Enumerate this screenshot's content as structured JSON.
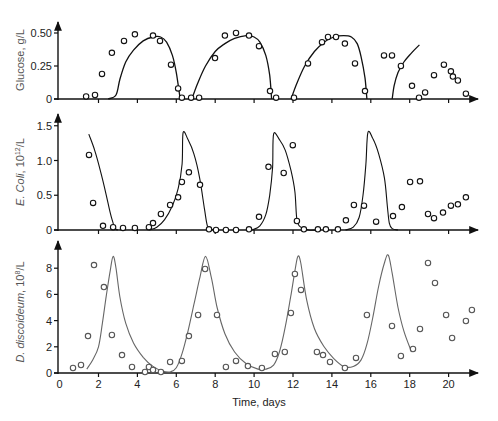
{
  "chart_data": [
    {
      "type": "line",
      "panel": "top",
      "title": "",
      "ylabel": "Glucose, g/L",
      "xlabel": "",
      "xlim": [
        0,
        21.5
      ],
      "ylim": [
        0,
        0.58
      ],
      "yticks": [
        0,
        0.25,
        0.5
      ],
      "ytick_labels": [
        "0",
        "0.25",
        "0.50"
      ],
      "xticks": [
        0,
        2,
        4,
        6,
        8,
        10,
        12,
        14,
        16,
        18,
        20
      ],
      "grid": false,
      "series": [
        {
          "name": "Experiment",
          "style": "open-circle",
          "x": [
            1.36,
            1.82,
            2.18,
            2.69,
            3.31,
            3.87,
            4.8,
            5.16,
            5.73,
            6.09,
            6.29,
            6.76,
            7.17,
            7.99,
            8.5,
            9.07,
            9.74,
            10.25,
            10.82,
            11.13,
            12.05,
            12.77,
            13.49,
            13.8,
            14.21,
            14.67,
            15.19,
            15.7,
            16.68,
            17.09,
            17.55,
            18.12,
            18.48,
            18.79,
            19.25,
            19.76,
            20.12,
            20.22,
            20.48,
            20.89
          ],
          "y": [
            0.02,
            0.03,
            0.19,
            0.35,
            0.44,
            0.49,
            0.48,
            0.44,
            0.26,
            0.08,
            0.01,
            0.01,
            0.01,
            0.31,
            0.48,
            0.5,
            0.48,
            0.4,
            0.06,
            0.01,
            0.01,
            0.27,
            0.43,
            0.47,
            0.47,
            0.42,
            0.27,
            0.06,
            0.33,
            0.33,
            0.25,
            0.1,
            0.01,
            0.05,
            0.18,
            0.26,
            0.21,
            0.17,
            0.14,
            0.04
          ]
        },
        {
          "name": "Model",
          "style": "solid-line",
          "segments": [
            {
              "x": [
                2.5,
                2.9,
                3.1,
                3.4,
                3.8,
                4.3,
                4.8,
                5.2,
                5.5,
                5.8,
                6.0,
                6.2
              ],
              "y": [
                0.0,
                0.03,
                0.15,
                0.28,
                0.37,
                0.44,
                0.47,
                0.47,
                0.43,
                0.33,
                0.2,
                0.0
              ]
            },
            {
              "x": [
                6.8,
                7.1,
                7.5,
                8.0,
                8.5,
                9.0,
                9.6,
                10.0,
                10.3,
                10.6,
                10.8,
                10.9
              ],
              "y": [
                0.0,
                0.12,
                0.25,
                0.36,
                0.42,
                0.46,
                0.48,
                0.47,
                0.43,
                0.33,
                0.18,
                0.0
              ]
            },
            {
              "x": [
                11.9,
                12.2,
                12.6,
                13.1,
                13.6,
                14.1,
                14.6,
                15.0,
                15.3,
                15.5,
                15.7,
                15.8
              ],
              "y": [
                0.0,
                0.12,
                0.25,
                0.36,
                0.43,
                0.47,
                0.48,
                0.47,
                0.42,
                0.32,
                0.16,
                0.0
              ]
            },
            {
              "x": [
                17.1,
                17.2,
                17.4,
                17.7,
                18.1,
                18.5
              ],
              "y": [
                0.0,
                0.1,
                0.2,
                0.28,
                0.35,
                0.41
              ]
            }
          ]
        }
      ]
    },
    {
      "type": "line",
      "panel": "middle",
      "title": "",
      "ylabel": "E. Coli, 10^12/L",
      "xlabel": "",
      "xlim": [
        0,
        21.5
      ],
      "ylim": [
        0,
        1.65
      ],
      "yticks": [
        0,
        0.5,
        1.0,
        1.5
      ],
      "ytick_labels": [
        "0",
        "0.5",
        "1.0",
        "1.5"
      ],
      "xticks": [
        0,
        2,
        4,
        6,
        8,
        10,
        12,
        14,
        16,
        18,
        20
      ],
      "grid": false,
      "series": [
        {
          "name": "Experiment",
          "style": "open-circle",
          "x": [
            1.51,
            1.72,
            2.23,
            2.75,
            3.26,
            3.87,
            4.59,
            4.8,
            5.21,
            5.68,
            6.09,
            6.29,
            6.65,
            7.22,
            7.68,
            8.04,
            8.55,
            9.07,
            9.74,
            10.25,
            10.74,
            11.52,
            11.99,
            12.2,
            12.56,
            13.28,
            13.69,
            14.31,
            14.72,
            15.13,
            15.65,
            16.27,
            17.14,
            17.6,
            18.02,
            18.53,
            18.94,
            19.25,
            19.71,
            20.12,
            20.48,
            20.89
          ],
          "y": [
            1.08,
            0.39,
            0.06,
            0.04,
            0.03,
            0.03,
            0.04,
            0.1,
            0.23,
            0.36,
            0.47,
            0.69,
            0.83,
            0.65,
            0.01,
            0.0,
            0.0,
            0.0,
            0.01,
            0.19,
            0.91,
            0.82,
            1.22,
            0.13,
            0.01,
            0.01,
            0.01,
            0.01,
            0.14,
            0.36,
            0.35,
            0.12,
            0.2,
            0.33,
            0.69,
            0.7,
            0.23,
            0.17,
            0.25,
            0.35,
            0.37,
            0.47
          ]
        },
        {
          "name": "Model",
          "style": "solid-line",
          "segments": [
            {
              "x": [
                1.5,
                1.8,
                2.1,
                2.4,
                2.6,
                2.75,
                2.85,
                3.0
              ],
              "y": [
                1.38,
                1.15,
                0.85,
                0.5,
                0.25,
                0.1,
                0.02,
                0.0
              ]
            },
            {
              "x": [
                4.6,
                5.0,
                5.4,
                5.8,
                6.1,
                6.3,
                6.35,
                6.6,
                6.9,
                7.2,
                7.45,
                7.6,
                7.8,
                8.1
              ],
              "y": [
                0.0,
                0.04,
                0.15,
                0.35,
                0.6,
                0.95,
                1.4,
                1.3,
                1.1,
                0.75,
                0.3,
                0.06,
                0.01,
                0.0
              ]
            },
            {
              "x": [
                9.9,
                10.3,
                10.6,
                10.8,
                10.95,
                11.0,
                11.3,
                11.6,
                11.9,
                12.1,
                12.2,
                12.4,
                12.8,
                13.2
              ],
              "y": [
                0.0,
                0.06,
                0.22,
                0.5,
                0.9,
                1.38,
                1.3,
                1.15,
                0.85,
                0.55,
                0.15,
                0.04,
                0.0,
                0.0
              ]
            },
            {
              "x": [
                14.7,
                15.1,
                15.4,
                15.6,
                15.75,
                15.85,
                16.1,
                16.4,
                16.7,
                16.85,
                16.95,
                17.1,
                17.4
              ],
              "y": [
                0.0,
                0.04,
                0.18,
                0.5,
                0.95,
                1.4,
                1.32,
                1.1,
                0.75,
                0.35,
                0.1,
                0.02,
                0.0
              ]
            }
          ]
        }
      ]
    },
    {
      "type": "line",
      "panel": "bottom",
      "title": "",
      "ylabel": "D. discoideum, 10^8/L",
      "xlabel": "Time, days",
      "xlim": [
        0,
        21.5
      ],
      "ylim": [
        0,
        9.8
      ],
      "yticks": [
        0,
        2,
        4,
        6,
        8
      ],
      "ytick_labels": [
        "0",
        "2",
        "4",
        "6",
        "8"
      ],
      "xticks": [
        0,
        2,
        4,
        6,
        8,
        10,
        12,
        14,
        16,
        18,
        20
      ],
      "xtick_labels": [
        "0",
        "2",
        "4",
        "6",
        "8",
        "10",
        "12",
        "14",
        "16",
        "18",
        "20"
      ],
      "grid": false,
      "series": [
        {
          "name": "Experiment",
          "style": "open-circle",
          "x": [
            0.69,
            1.1,
            1.46,
            1.77,
            2.28,
            2.69,
            3.21,
            3.72,
            4.39,
            4.59,
            4.8,
            5.21,
            5.68,
            6.29,
            6.65,
            7.12,
            7.48,
            8.09,
            8.55,
            9.07,
            9.68,
            10.4,
            11.07,
            11.58,
            11.89,
            12.1,
            12.41,
            13.23,
            13.54,
            13.9,
            14.67,
            15.24,
            15.8,
            17.09,
            17.55,
            18.17,
            18.53,
            18.94,
            19.3,
            19.87,
            20.18,
            20.89,
            21.2
          ],
          "y": [
            0.38,
            0.61,
            2.82,
            8.24,
            6.56,
            2.9,
            1.37,
            0.46,
            0.08,
            0.46,
            0.23,
            0.08,
            0.84,
            0.92,
            2.82,
            4.43,
            7.94,
            4.43,
            0.46,
            0.92,
            0.53,
            0.38,
            1.45,
            1.6,
            4.58,
            7.56,
            6.34,
            1.6,
            1.37,
            0.84,
            0.38,
            1.15,
            4.43,
            3.59,
            1.3,
            1.83,
            3.36,
            8.4,
            6.87,
            4.43,
            2.67,
            3.97,
            4.81
          ]
        },
        {
          "name": "Model",
          "style": "solid-line",
          "segments": [
            {
              "x": [
                1.4,
                1.7,
                2.0,
                2.2,
                2.4,
                2.6,
                2.75,
                2.9,
                3.1,
                3.4,
                3.8,
                4.3,
                4.8,
                5.3,
                5.7,
                6.0,
                6.3,
                6.6,
                6.9,
                7.2,
                7.5,
                7.8,
                8.1,
                8.5,
                9.0,
                9.6,
                10.2,
                10.6,
                11.0,
                11.3,
                11.6,
                11.9,
                12.1,
                12.25,
                12.4,
                12.7,
                13.1,
                13.6,
                14.1,
                14.6,
                15.1,
                15.5,
                15.8,
                16.1,
                16.4,
                16.7,
                16.9,
                17.1,
                17.4,
                17.7,
                18.1
              ],
              "y": [
                0.3,
                1.0,
                2.0,
                3.8,
                5.9,
                7.8,
                8.9,
                8.0,
                5.8,
                3.8,
                2.3,
                1.2,
                0.5,
                0.15,
                0.1,
                0.4,
                1.5,
                3.2,
                5.2,
                7.2,
                8.9,
                7.3,
                5.0,
                3.0,
                1.6,
                0.7,
                0.3,
                0.3,
                0.6,
                1.6,
                3.5,
                6.0,
                7.8,
                8.9,
                8.4,
                5.6,
                3.4,
                2.0,
                1.1,
                0.5,
                0.5,
                1.0,
                2.2,
                4.2,
                6.6,
                8.4,
                9.0,
                7.6,
                5.0,
                3.2,
                1.6
              ]
            }
          ]
        }
      ]
    }
  ]
}
